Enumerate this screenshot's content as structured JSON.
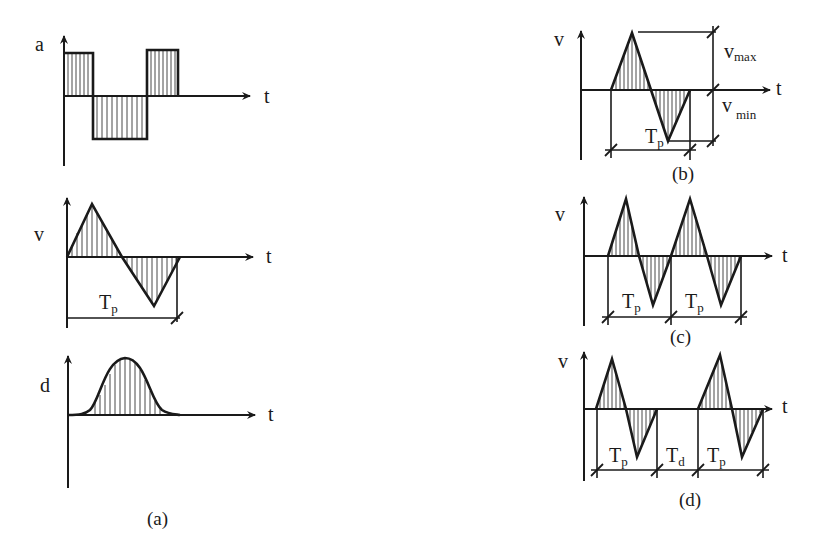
{
  "figure": {
    "panel_a": {
      "caption": "(a)",
      "plots": [
        {
          "ylabel": "a",
          "xlabel": "t",
          "shape": "square pulses (positive, negative, positive)"
        },
        {
          "ylabel": "v",
          "xlabel": "t",
          "shape": "single triangular cycle",
          "period_label": "T",
          "period_sub": "p"
        },
        {
          "ylabel": "d",
          "xlabel": "t",
          "shape": "bell-shaped pulse"
        }
      ]
    },
    "panel_b": {
      "caption": "(b)",
      "ylabel": "v",
      "xlabel": "t",
      "period_label": "T",
      "period_sub": "p",
      "vmax_label": "v",
      "vmax_sub": "max",
      "vmin_label": "v",
      "vmin_sub": "min"
    },
    "panel_c": {
      "caption": "(c)",
      "ylabel": "v",
      "xlabel": "t",
      "periods": [
        {
          "label": "T",
          "sub": "p"
        },
        {
          "label": "T",
          "sub": "p"
        }
      ]
    },
    "panel_d": {
      "caption": "(d)",
      "ylabel": "v",
      "xlabel": "t",
      "intervals": [
        {
          "label": "T",
          "sub": "p"
        },
        {
          "label": "T",
          "sub": "d"
        },
        {
          "label": "T",
          "sub": "p"
        }
      ]
    }
  }
}
